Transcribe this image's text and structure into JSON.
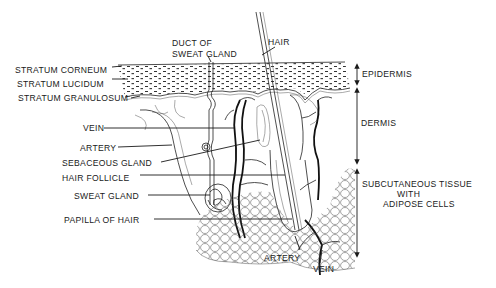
{
  "diagram": {
    "labels_left": [
      {
        "id": "stratum-corneum",
        "text": "STRATUM CORNEUM"
      },
      {
        "id": "stratum-lucidum",
        "text": "STRATUM LUCIDUM"
      },
      {
        "id": "stratum-granulosum",
        "text": "STRATUM GRANULOSUM"
      },
      {
        "id": "vein",
        "text": "VEIN"
      },
      {
        "id": "artery",
        "text": "ARTERY"
      },
      {
        "id": "sebaceous-gland",
        "text": "SEBACEOUS GLAND"
      },
      {
        "id": "hair-follicle",
        "text": "HAIR FOLLICLE"
      },
      {
        "id": "sweat-gland",
        "text": "SWEAT GLAND"
      },
      {
        "id": "papilla-of-hair",
        "text": "PAPILLA OF HAIR"
      }
    ],
    "labels_top": {
      "duct_line1": "DUCT OF",
      "duct_line2": "SWEAT GLAND",
      "hair": "HAIR"
    },
    "labels_right": {
      "epidermis": "EPIDERMIS",
      "dermis": "DERMIS",
      "subcutaneous_line1": "SUBCUTANEOUS TISSUE",
      "subcutaneous_line2": "WITH",
      "subcutaneous_line3": "ADIPOSE CELLS"
    },
    "labels_bottom": {
      "artery": "ARTERY",
      "vein": "VEIN"
    }
  }
}
